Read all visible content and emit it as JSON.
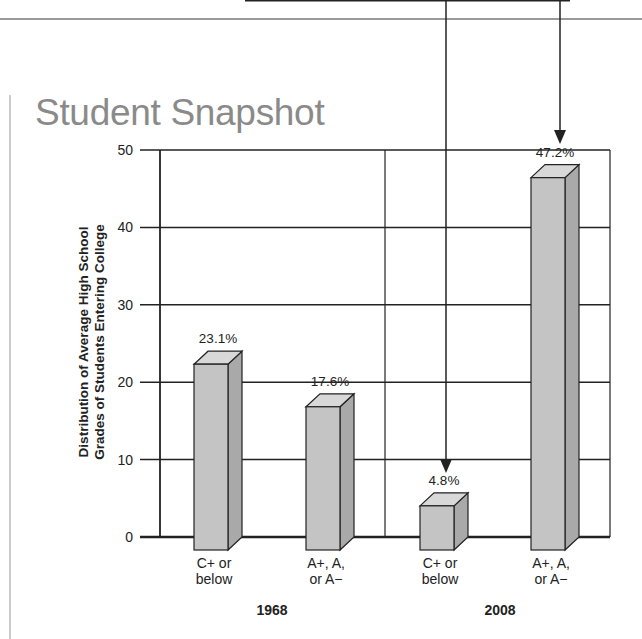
{
  "title": "Student Snapshot",
  "chart_data": {
    "type": "bar",
    "title": "Student Snapshot",
    "ylabel": "Distribution of Average High School Grades of Students Entering College",
    "ylabel_lines": [
      "Distribution of Average High School",
      "Grades of Students Entering College"
    ],
    "xlabel": "",
    "ylim": [
      0,
      50
    ],
    "yticks": [
      0,
      10,
      20,
      30,
      40,
      50
    ],
    "grid": true,
    "groups": [
      {
        "label": "1968",
        "bars": [
          {
            "category_lines": [
              "C+ or",
              "below"
            ],
            "category": "C+ or below",
            "value": 23.1,
            "label": "23.1%"
          },
          {
            "category_lines": [
              "A+, A,",
              "or A−"
            ],
            "category": "A+, A, or A−",
            "value": 17.6,
            "label": "17.6%"
          }
        ]
      },
      {
        "label": "2008",
        "bars": [
          {
            "category_lines": [
              "C+ or",
              "below"
            ],
            "category": "C+ or below",
            "value": 4.8,
            "label": "4.8%"
          },
          {
            "category_lines": [
              "A+, A,",
              "or A−"
            ],
            "category": "A+, A, or A−",
            "value": 47.2,
            "label": "47.2%"
          }
        ]
      }
    ],
    "categories": [
      "1968 C+ or below",
      "1968 A+, A, or A−",
      "2008 C+ or below",
      "2008 A+, A, or A−"
    ],
    "values": [
      23.1,
      17.6,
      4.8,
      47.2
    ],
    "annotations": [
      "Arrows pointing down to 2008 bars"
    ]
  }
}
